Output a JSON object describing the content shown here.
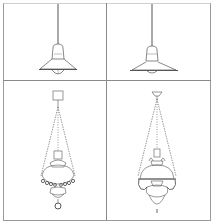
{
  "figure": {
    "layout": "2x2 grid of line drawings",
    "line_color": "#555555",
    "border_color": "#9a9a9a",
    "panels": [
      {
        "position": "top-left",
        "subject": "pendant lamp with wide conical shade and bulb, hanging on rod"
      },
      {
        "position": "top-right",
        "subject": "pendant lamp with flat wide shade, hanging on rod"
      },
      {
        "position": "bottom-left",
        "subject": "chain-hung oil lamp with globe and beaded band, ring finial"
      },
      {
        "position": "bottom-right",
        "subject": "ornate chain-hung oil lamp with dome shade and decorative scrolls, pointed finial"
      }
    ]
  }
}
